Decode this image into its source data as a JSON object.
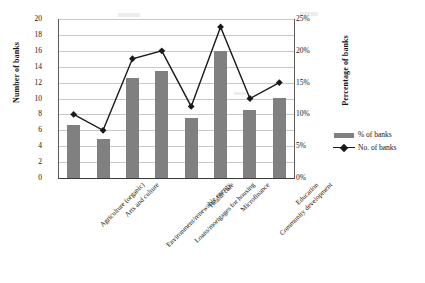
{
  "chart_data": {
    "type": "bar",
    "title": "",
    "subtitle": "",
    "xlabel": "",
    "ylabel": "Number of banks",
    "y2label": "Percentage of banks",
    "grid": true,
    "legend_position": "right",
    "categories": [
      "Agriculture (organic)",
      "Arts and culture",
      "Environment/renewable energy",
      "Loans/mortgages for housing",
      "Health care",
      "Microfinance",
      "Community development",
      "Education"
    ],
    "ylim": [
      0,
      20
    ],
    "y2lim": [
      0,
      25
    ],
    "yticks": [
      0,
      2,
      4,
      6,
      8,
      10,
      12,
      14,
      16,
      18,
      20
    ],
    "ytick_labels": [
      "0",
      "2",
      "4",
      "6",
      "8",
      "10",
      "12",
      "14",
      "16",
      "18",
      "20"
    ],
    "y2ticks": [
      0,
      5,
      10,
      15,
      20,
      25
    ],
    "y2tick_labels": [
      "0%",
      "5%",
      "10%",
      "15%",
      "20%",
      "25%"
    ],
    "series": [
      {
        "name": "% of banks",
        "type": "bar",
        "axis": "right",
        "color": "#808080",
        "values": [
          8.4,
          6.1,
          15.8,
          16.9,
          9.5,
          20.0,
          10.6,
          12.6
        ],
        "values_left_axis": [
          6.7,
          4.9,
          12.6,
          13.5,
          7.6,
          16.0,
          8.5,
          10.1
        ]
      },
      {
        "name": "No. of banks",
        "type": "line",
        "axis": "left",
        "color": "#1a1a1a",
        "marker": "diamond",
        "values": [
          8,
          6,
          15,
          16,
          9,
          19,
          10,
          12
        ]
      }
    ]
  },
  "legend": {
    "items": [
      {
        "label": "% of banks",
        "marker": "bar-swatch"
      },
      {
        "label": "No. of banks",
        "marker": "line-diamond"
      }
    ]
  }
}
